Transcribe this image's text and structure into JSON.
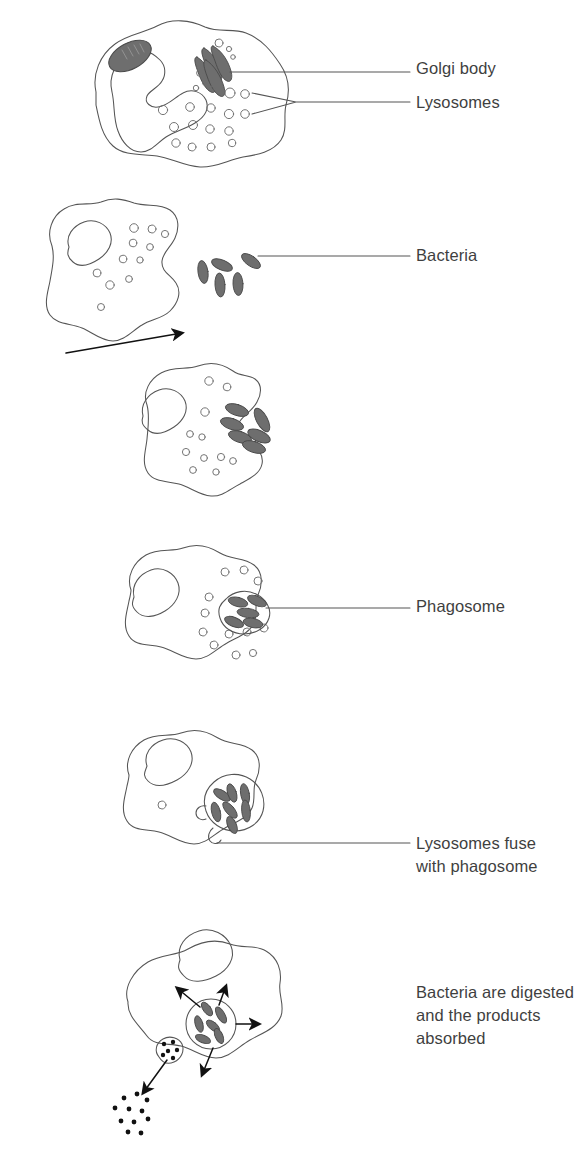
{
  "figure": {
    "background": "#ffffff",
    "ink": "#555555",
    "organelle_fill": "#6e6e6e",
    "organelle_stroke": "#4a4a4a",
    "text_color": "#3f3f3f",
    "arrow_color": "#111111"
  },
  "labels": [
    {
      "id": "golgi",
      "text": "Golgi body",
      "x": 416,
      "y": 57
    },
    {
      "id": "lysosomes",
      "text": "Lysosomes",
      "x": 416,
      "y": 91
    },
    {
      "id": "bacteria",
      "text": "Bacteria",
      "x": 416,
      "y": 244
    },
    {
      "id": "phagosome",
      "text": "Phagosome",
      "x": 416,
      "y": 595
    },
    {
      "id": "fuse1",
      "text": "Lysosomes fuse",
      "x": 416,
      "y": 832
    },
    {
      "id": "fuse2",
      "text": "with phagosome",
      "x": 416,
      "y": 855
    },
    {
      "id": "digest1",
      "text": "Bacteria are digested",
      "x": 416,
      "y": 981
    },
    {
      "id": "digest2",
      "text": "and the products",
      "x": 416,
      "y": 1004
    },
    {
      "id": "absorbed",
      "text": "absorbed",
      "x": 416,
      "y": 1027
    }
  ],
  "stages": [
    {
      "id": "stage-1",
      "name": "phagocyte-with-organelles",
      "caption_refs": [
        "Golgi body",
        "Lysosomes"
      ],
      "organelles": [
        "nucleus",
        "mitochondrion",
        "golgi-body",
        "lysosomes"
      ],
      "lysosome_count": 22
    },
    {
      "id": "stage-2",
      "name": "phagocyte-approaching-bacteria",
      "caption_refs": [
        "Bacteria"
      ],
      "organelles": [
        "nucleus",
        "lysosomes"
      ],
      "bacteria_count": 6,
      "lysosome_count": 12
    },
    {
      "id": "stage-3",
      "name": "pseudopodia-engulfing-bacteria",
      "caption_refs": [],
      "organelles": [
        "nucleus",
        "lysosomes",
        "bacteria"
      ],
      "bacteria_count": 6,
      "lysosome_count": 11
    },
    {
      "id": "stage-4",
      "name": "bacteria-enclosed-in-phagosome",
      "caption_refs": [
        "Phagosome"
      ],
      "organelles": [
        "nucleus",
        "lysosomes",
        "phagosome",
        "bacteria"
      ],
      "bacteria_count": 5,
      "lysosome_count": 12
    },
    {
      "id": "stage-5",
      "name": "lysosomes-fusing-with-phagosome",
      "caption_refs": [
        "Lysosomes fuse",
        "with phagosome"
      ],
      "organelles": [
        "nucleus",
        "phagosome",
        "bacteria",
        "fusing-lysosomes"
      ],
      "bacteria_count": 7
    },
    {
      "id": "stage-6",
      "name": "digestion-and-absorption",
      "caption_refs": [
        "Bacteria are digested",
        "and the products",
        "absorbed"
      ],
      "organelles": [
        "nucleus",
        "phagolysosome",
        "bacteria",
        "waste-vesicle"
      ],
      "bacteria_count": 6,
      "absorption_arrows": 4,
      "expelled_particle_count": 11
    }
  ]
}
